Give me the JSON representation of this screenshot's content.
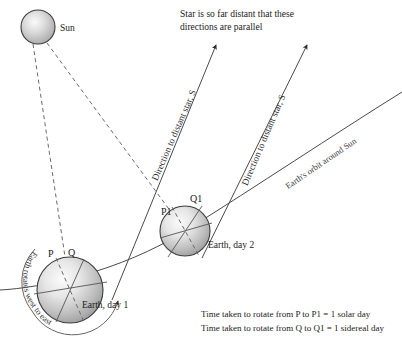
{
  "diagram": {
    "title_note": "Star is so far distant that these directions are parallel",
    "labels": {
      "sun": "Sun",
      "earth_day1": "Earth,  day 1",
      "earth_day2": "Earth,  day 2",
      "point_p": "P",
      "point_q": "Q",
      "point_p1": "P1",
      "point_q1": "Q1",
      "direction_star_left": "Direction to distant star, S",
      "direction_star_right": "Direction to distant star, S",
      "orbit": "Earth's orbit around Sun",
      "rotation": "Earth rotates west to east"
    },
    "footnotes": [
      "Time taken to rotate from P to P1 = 1 solar day",
      "Time taken to rotate from Q to Q1 = 1 sidereal day"
    ],
    "colors": {
      "background": "#ffffff",
      "line": "#4a4a4a",
      "dashed": "#6a6a6a",
      "text": "#1a1a1a",
      "body_fill_light": "#f2f2f2",
      "body_fill_dark": "#9a9a9a"
    },
    "geometry": {
      "sun": {
        "cx": 38,
        "cy": 27,
        "r": 17
      },
      "earth_day1": {
        "cx": 70,
        "cy": 290,
        "r": 33
      },
      "earth_day2": {
        "cx": 185,
        "cy": 231,
        "r": 25
      },
      "star_direction_angle_deg": 60
    }
  }
}
